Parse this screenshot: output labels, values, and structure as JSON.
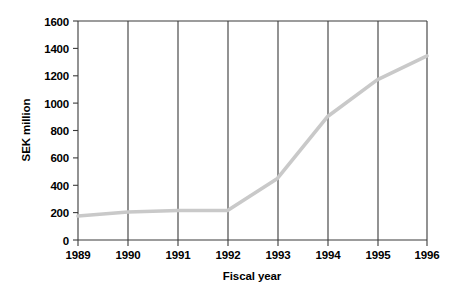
{
  "chart_data": {
    "type": "line",
    "title": "",
    "subtitle": "",
    "xlabel": "Fiscal year",
    "ylabel": "SEK million",
    "categories": [
      "1989",
      "1990",
      "1991",
      "1992",
      "1993",
      "1994",
      "1995",
      "1996"
    ],
    "x": [
      1989,
      1990,
      1991,
      1992,
      1993,
      1994,
      1995,
      1996
    ],
    "values": [
      175,
      205,
      215,
      215,
      450,
      900,
      1170,
      1345
    ],
    "series": [
      {
        "name": "SEK million",
        "values": [
          175,
          205,
          215,
          215,
          450,
          900,
          1170,
          1345
        ]
      }
    ],
    "ylim": [
      0,
      1600
    ],
    "yticks": [
      0,
      200,
      400,
      600,
      800,
      1000,
      1200,
      1400,
      1600
    ],
    "ytick_labels": [
      "0",
      "200",
      "400",
      "600",
      "800",
      "1000",
      "1200",
      "1400",
      "1600"
    ],
    "xtick_labels": [
      "1989",
      "1990",
      "1991",
      "1992",
      "1993",
      "1994",
      "1995",
      "1996"
    ],
    "grid": "vertical",
    "legend": "none",
    "line_color": "#c9c9c9",
    "axis_color": "#3a3a3a",
    "text_color": "#000000",
    "background": "#ffffff"
  },
  "axes": {
    "y_title": "SEK million",
    "x_title": "Fiscal year"
  }
}
